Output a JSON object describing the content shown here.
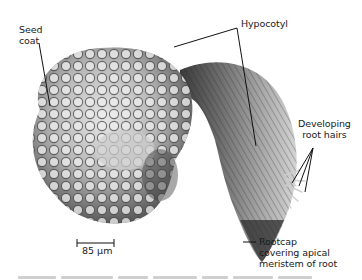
{
  "figure": {
    "type": "scanning electron micrograph"
  },
  "labels": {
    "seed_coat": "Seed\ncoat",
    "hypocotyl": "Hypocotyl",
    "root_hairs": "Developing\nroot hairs",
    "rootcap": "Rootcap\ncovering apical\nmeristem of root"
  },
  "scale_bar": {
    "label": "85 μm"
  },
  "colors": {
    "background": "#ffffff",
    "leader_lines": "#111111",
    "specimen_light": "#d9d9d9",
    "specimen_dark": "#2a2a2a"
  }
}
